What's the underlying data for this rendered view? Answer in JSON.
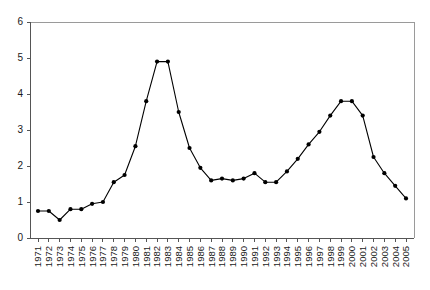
{
  "chart_data": {
    "type": "line",
    "title": "",
    "subtitle": "",
    "xlabel": "",
    "ylabel": "",
    "xlim": [
      1971,
      2005
    ],
    "ylim": [
      0,
      6
    ],
    "grid": false,
    "legend": null,
    "legend_position": "none",
    "marker": "filled-circle",
    "line_color": "#000000",
    "marker_color": "#000000",
    "axis_color": "#555555",
    "frame_color": "#9a9a9a",
    "y_ticks": [
      0,
      1,
      2,
      3,
      4,
      5,
      6
    ],
    "y_tick_labels": [
      "0",
      "1",
      "2",
      "3",
      "4",
      "5",
      "6"
    ],
    "categories": [
      "1971",
      "1972",
      "1973",
      "1974",
      "1975",
      "1976",
      "1977",
      "1978",
      "1979",
      "1980",
      "1981",
      "1982",
      "1983",
      "1984",
      "1985",
      "1986",
      "1987",
      "1988",
      "1989",
      "1990",
      "1991",
      "1992",
      "1993",
      "1994",
      "1995",
      "1996",
      "1997",
      "1998",
      "1999",
      "2000",
      "2001",
      "2002",
      "2003",
      "2004",
      "2005"
    ],
    "x": [
      1971,
      1972,
      1973,
      1974,
      1975,
      1976,
      1977,
      1978,
      1979,
      1980,
      1981,
      1982,
      1983,
      1984,
      1985,
      1986,
      1987,
      1988,
      1989,
      1990,
      1991,
      1992,
      1993,
      1994,
      1995,
      1996,
      1997,
      1998,
      1999,
      2000,
      2001,
      2002,
      2003,
      2004,
      2005
    ],
    "values": [
      0.75,
      0.75,
      0.5,
      0.8,
      0.8,
      0.95,
      1.0,
      1.55,
      1.75,
      2.55,
      3.8,
      4.9,
      4.9,
      3.5,
      2.5,
      1.95,
      1.6,
      1.65,
      1.6,
      1.65,
      1.8,
      1.55,
      1.55,
      1.85,
      2.2,
      2.6,
      2.95,
      3.4,
      3.8,
      3.8,
      3.4,
      2.25,
      1.8,
      1.45,
      1.1
    ],
    "annotations": []
  },
  "plot_geometry": {
    "left": 30,
    "right": 414,
    "top": 22,
    "bottom": 238
  }
}
